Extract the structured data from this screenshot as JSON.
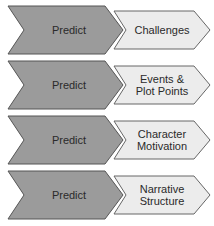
{
  "diagram": {
    "colors": {
      "dark_fill": "#9b9b9b",
      "light_fill": "#ececec",
      "stroke": "#555555",
      "text": "#2a2a2a"
    },
    "rows": [
      {
        "left": "Predict",
        "right": "Challenges"
      },
      {
        "left": "Predict",
        "right": "Events & Plot Points"
      },
      {
        "left": "Predict",
        "right": "Character Motivation"
      },
      {
        "left": "Predict",
        "right": "Narrative Structure"
      }
    ]
  }
}
